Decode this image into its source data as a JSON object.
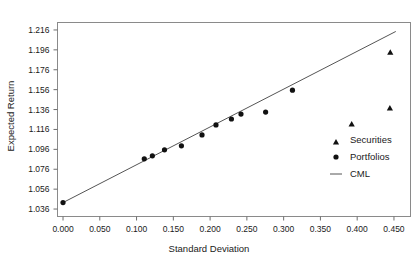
{
  "chart_data": {
    "type": "scatter",
    "title": "",
    "xlabel": "Standard Deviation",
    "ylabel": "Expected Return",
    "xlim": [
      -0.0075,
      0.4725
    ],
    "ylim": [
      1.0285,
      1.2235
    ],
    "grid": false,
    "legend_position": "inside-right",
    "xticks": [
      0.0,
      0.05,
      0.1,
      0.15,
      0.2,
      0.25,
      0.3,
      0.35,
      0.4,
      0.45
    ],
    "xticklabels": [
      "0.000",
      "0.050",
      "0.100",
      "0.150",
      "0.200",
      "0.250",
      "0.300",
      "0.350",
      "0.400",
      "0.450"
    ],
    "yticks": [
      1.036,
      1.056,
      1.076,
      1.096,
      1.116,
      1.136,
      1.156,
      1.176,
      1.196,
      1.216
    ],
    "yticklabels": [
      "1.036",
      "1.056",
      "1.076",
      "1.096",
      "1.116",
      "1.136",
      "1.156",
      "1.176",
      "1.196",
      "1.216"
    ],
    "series": [
      {
        "name": "Securities",
        "marker": "triangle",
        "color": "#111111",
        "points": [
          {
            "x": 0.3925,
            "y": 1.1215
          },
          {
            "x": 0.4445,
            "y": 1.1375
          },
          {
            "x": 0.445,
            "y": 1.1935
          }
        ]
      },
      {
        "name": "Portfolios",
        "marker": "circle",
        "color": "#111111",
        "points": [
          {
            "x": 0.0,
            "y": 1.0425
          },
          {
            "x": 0.1105,
            "y": 1.0865
          },
          {
            "x": 0.1215,
            "y": 1.0895
          },
          {
            "x": 0.138,
            "y": 1.0955
          },
          {
            "x": 0.161,
            "y": 1.0995
          },
          {
            "x": 0.189,
            "y": 1.1105
          },
          {
            "x": 0.208,
            "y": 1.1205
          },
          {
            "x": 0.229,
            "y": 1.1265
          },
          {
            "x": 0.242,
            "y": 1.1315
          },
          {
            "x": 0.2755,
            "y": 1.1335
          },
          {
            "x": 0.312,
            "y": 1.1555
          }
        ]
      },
      {
        "name": "CML",
        "marker": "line",
        "color": "#555555",
        "line": {
          "x0": 0.0,
          "y0": 1.0425,
          "x1": 0.4525,
          "y1": 1.2145
        }
      }
    ],
    "legend": [
      {
        "label": "Securities",
        "marker": "triangle"
      },
      {
        "label": "Portfolios",
        "marker": "circle"
      },
      {
        "label": "CML",
        "marker": "line"
      }
    ]
  }
}
